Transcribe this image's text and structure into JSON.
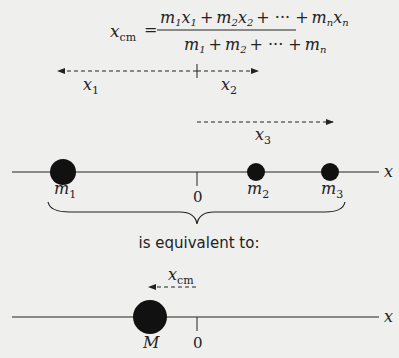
{
  "formula": {
    "lhs": "x",
    "lhs_sub": "cm",
    "equals": "=",
    "numerator": [
      {
        "m": "m",
        "ms": "1",
        "x": "x",
        "xs": "1"
      },
      {
        "op": "+"
      },
      {
        "m": "m",
        "ms": "2",
        "x": "x",
        "xs": "2"
      },
      {
        "op": "+ ··· +"
      },
      {
        "m": "m",
        "ms": "n",
        "x": "x",
        "xs": "n"
      }
    ],
    "denominator": "m1 + m2 + ··· + mn",
    "den_terms": {
      "m1": "m",
      "s1": "1",
      "plus1": "+",
      "m2": "m",
      "s2": "2",
      "dots": "+ ··· +",
      "mn": "m",
      "sn": "n"
    }
  },
  "arrows": {
    "x1": {
      "label": "x",
      "sub": "1",
      "direction": "left"
    },
    "x2": {
      "label": "x",
      "sub": "2",
      "direction": "right"
    },
    "x3": {
      "label": "x",
      "sub": "3",
      "direction": "right"
    },
    "xcm": {
      "label": "x",
      "sub": "cm",
      "direction": "left"
    }
  },
  "axis_top": {
    "axis_label": "x",
    "origin_label": "0",
    "masses": [
      {
        "name": "m",
        "sub": "1",
        "size": "large"
      },
      {
        "name": "m",
        "sub": "2",
        "size": "small"
      },
      {
        "name": "m",
        "sub": "3",
        "size": "small"
      }
    ]
  },
  "caption": "is equivalent to:",
  "axis_bottom": {
    "axis_label": "x",
    "origin_label": "0",
    "mass": {
      "name": "M"
    }
  },
  "colors": {
    "background": "#efefee",
    "ink": "#222222"
  }
}
